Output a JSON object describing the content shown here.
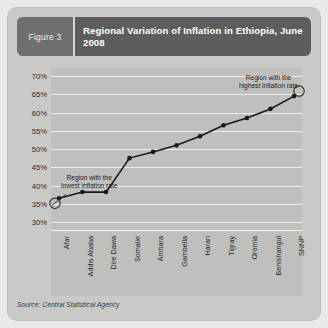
{
  "figure": {
    "tab_label": "Figure 3",
    "title": "Regional Variation of Inflation in Ethiopia, June 2008"
  },
  "footer": {
    "source": "Source: Central Statistical Agency"
  },
  "annotations": {
    "lowest": "Region with the\nlowest inflation rate",
    "lowest_line1": "Region with the",
    "lowest_line2": "lowest inflation rate",
    "highest_line1": "Region with the",
    "highest_line2": "highest inflation rate"
  },
  "colors": {
    "card_bg": "#c9c9c7",
    "plot_bg": "#bfbfbd",
    "header_bg": "#5d5d5d",
    "tab_bg": "#6f6f6f",
    "line": "#181818",
    "gridline": "#efeeec"
  },
  "chart_data": {
    "type": "line",
    "title": "Regional Variation of Inflation in Ethiopia, June 2008",
    "xlabel": "",
    "ylabel": "",
    "ylim": [
      30,
      70
    ],
    "ytick_step": 5,
    "ytick_labels": [
      "70%",
      "65%",
      "60%",
      "55%",
      "50%",
      "45%",
      "40%",
      "35%",
      "30%"
    ],
    "ytick_values": [
      70,
      65,
      60,
      55,
      50,
      45,
      40,
      35,
      30
    ],
    "grid": true,
    "legend": "none",
    "categories": [
      "Afar",
      "Addis Ababa",
      "Dire Dawa",
      "Somalie",
      "Amhara",
      "Gambella",
      "Harari",
      "Tigray",
      "Oromia",
      "Benishangul",
      "SNNP"
    ],
    "values": [
      36.5,
      38.2,
      38.2,
      47.5,
      49.2,
      51.0,
      53.5,
      56.5,
      58.5,
      61.0,
      64.5
    ],
    "series": [
      {
        "name": "Inflation rate",
        "values": [
          36.5,
          38.2,
          38.2,
          47.5,
          49.2,
          51.0,
          53.5,
          56.5,
          58.5,
          61.0,
          64.5
        ]
      }
    ],
    "annotations": [
      {
        "label": "Region with the lowest inflation rate",
        "target_category": "Afar",
        "target_value": 36.5
      },
      {
        "label": "Region with the highest inflation rate",
        "target_category": "SNNP",
        "target_value": 64.5
      }
    ]
  }
}
